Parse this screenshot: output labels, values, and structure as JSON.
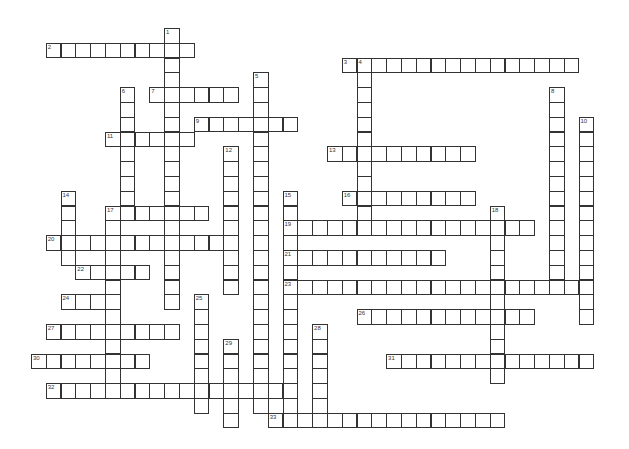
{
  "puzzle": {
    "type": "crossword",
    "grid": {
      "cell_size": 14.8,
      "origin_x": 31.3,
      "origin_y": 28.3,
      "line_color": "#333333",
      "background": "#ffffff"
    },
    "across": [
      {
        "number": "2",
        "row": 1,
        "col": 1,
        "length": 10
      },
      {
        "number": "3",
        "row": 2,
        "col": 21,
        "length": 16
      },
      {
        "number": "7",
        "row": 4,
        "col": 8,
        "length": 6
      },
      {
        "number": "9",
        "row": 6,
        "col": 11,
        "length": 7
      },
      {
        "number": "11",
        "row": 7,
        "col": 5,
        "length": 6
      },
      {
        "number": "13",
        "row": 8,
        "col": 20,
        "length": 10
      },
      {
        "number": "16",
        "row": 11,
        "col": 21,
        "length": 9
      },
      {
        "number": "17",
        "row": 12,
        "col": 5,
        "length": 7
      },
      {
        "number": "19",
        "row": 13,
        "col": 17,
        "length": 17
      },
      {
        "number": "20",
        "row": 14,
        "col": 1,
        "length": 13
      },
      {
        "number": "21",
        "row": 15,
        "col": 17,
        "length": 11
      },
      {
        "number": "22",
        "row": 16,
        "col": 3,
        "length": 5
      },
      {
        "number": "23",
        "row": 17,
        "col": 17,
        "length": 21
      },
      {
        "number": "24",
        "row": 18,
        "col": 2,
        "length": 4
      },
      {
        "number": "26",
        "row": 19,
        "col": 22,
        "length": 12
      },
      {
        "number": "27",
        "row": 20,
        "col": 1,
        "length": 9
      },
      {
        "number": "30",
        "row": 22,
        "col": 0,
        "length": 8
      },
      {
        "number": "31",
        "row": 22,
        "col": 24,
        "length": 14
      },
      {
        "number": "32",
        "row": 24,
        "col": 1,
        "length": 17
      },
      {
        "number": "33",
        "row": 26,
        "col": 16,
        "length": 16
      }
    ],
    "down": [
      {
        "number": "1",
        "row": 0,
        "col": 9,
        "length": 19
      },
      {
        "number": "4",
        "row": 2,
        "col": 22,
        "length": 12
      },
      {
        "number": "5",
        "row": 3,
        "col": 15,
        "length": 23
      },
      {
        "number": "6",
        "row": 4,
        "col": 6,
        "length": 9
      },
      {
        "number": "8",
        "row": 4,
        "col": 35,
        "length": 14
      },
      {
        "number": "10",
        "row": 6,
        "col": 37,
        "length": 14
      },
      {
        "number": "12",
        "row": 8,
        "col": 13,
        "length": 10
      },
      {
        "number": "14",
        "row": 11,
        "col": 2,
        "length": 5
      },
      {
        "number": "15",
        "row": 11,
        "col": 17,
        "length": 15
      },
      {
        "number": "17",
        "row": 12,
        "col": 5,
        "length": 13
      },
      {
        "number": "18",
        "row": 12,
        "col": 31,
        "length": 12
      },
      {
        "number": "25",
        "row": 18,
        "col": 11,
        "length": 8
      },
      {
        "number": "28",
        "row": 20,
        "col": 19,
        "length": 7
      },
      {
        "number": "29",
        "row": 21,
        "col": 13,
        "length": 6
      }
    ]
  }
}
